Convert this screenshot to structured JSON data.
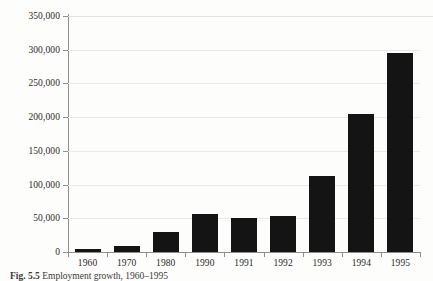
{
  "figure": {
    "caption_label": "Fig. 5.5",
    "caption_text": "Employment growth, 1960–1995"
  },
  "axis": {
    "y_labels": [
      "0",
      "50,000",
      "100,000",
      "150,000",
      "200,000",
      "250,000",
      "300,000",
      "350,000"
    ]
  },
  "chart_data": {
    "type": "bar",
    "title": "",
    "subtitle": "",
    "xlabel": "",
    "ylabel": "",
    "categories": [
      "1960",
      "1970",
      "1980",
      "1990",
      "1991",
      "1992",
      "1993",
      "1994",
      "1995"
    ],
    "values": [
      5000,
      9000,
      30000,
      57000,
      51000,
      53000,
      112000,
      205000,
      295000
    ],
    "ylim": [
      0,
      350000
    ],
    "ytick_step": 50000,
    "yticks": [
      0,
      50000,
      100000,
      150000,
      200000,
      250000,
      300000,
      350000
    ],
    "ytick_labels": [
      "0",
      "50,000",
      "100,000",
      "150,000",
      "200,000",
      "250,000",
      "300,000",
      "350,000"
    ],
    "grid": true,
    "legend": false,
    "legend_position": "none",
    "bar_color": "#141414",
    "grid_color": "#e9e9e7",
    "axis_color": "#8e8e8e",
    "background_color": "#fdfdfc",
    "series": [
      {
        "name": "Employment",
        "values": [
          5000,
          9000,
          30000,
          57000,
          51000,
          53000,
          112000,
          205000,
          295000
        ]
      }
    ]
  }
}
